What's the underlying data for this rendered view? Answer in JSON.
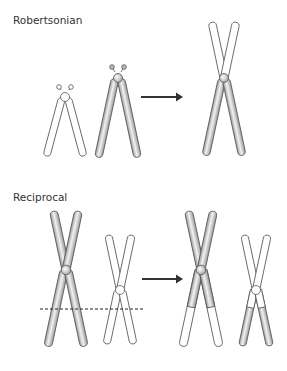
{
  "panels": [
    {
      "title": "Robertsonian"
    },
    {
      "title": "Reciprocal"
    }
  ],
  "colors": {
    "stroke": "#555555",
    "shaded": "#cfcfcf",
    "unshaded": "#ffffff",
    "arrow": "#333333"
  }
}
